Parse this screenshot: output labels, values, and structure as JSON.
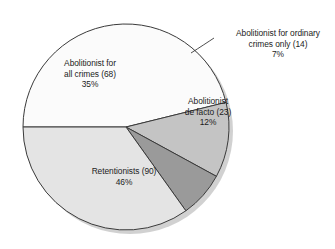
{
  "chart_data": {
    "type": "pie",
    "title": "",
    "subtitle": "",
    "xlabel": "",
    "ylabel": "",
    "legend_position": "none",
    "grid": false,
    "total_count": 195,
    "categories": [
      "Abolitionist for all crimes",
      "Abolitionist for ordinary crimes only",
      "Abolitionist de facto",
      "Retentionists"
    ],
    "values": [
      68,
      14,
      23,
      90
    ],
    "percentages": [
      35,
      7,
      12,
      46
    ],
    "colors": [
      "#e4e4e4",
      "#9a9a9a",
      "#c4c4c4",
      "#fbfbfb"
    ],
    "start_angle_deg": 180,
    "direction": "clockwise",
    "slices": [
      {
        "name": "abolitionist-all-crimes",
        "label_line1": "Abolitionist for",
        "label_line2": "all crimes (68)",
        "percent_label": "35%",
        "count": 68,
        "percent": 35,
        "color": "#e4e4e4",
        "label_placement": "inside"
      },
      {
        "name": "abolitionist-ordinary-crimes-only",
        "label_line1": "Abolitionist for ordinary",
        "label_line2": "crimes only (14)",
        "percent_label": "7%",
        "count": 14,
        "percent": 7,
        "color": "#9a9a9a",
        "label_placement": "callout"
      },
      {
        "name": "abolitionist-de-facto",
        "label_line1": "Abolitionist",
        "label_line2": "de facto (23)",
        "percent_label": "12%",
        "count": 23,
        "percent": 12,
        "color": "#c4c4c4",
        "label_placement": "inside"
      },
      {
        "name": "retentionists",
        "label_line1": "Retentionists (90)",
        "label_line2": "",
        "percent_label": "46%",
        "count": 90,
        "percent": 46,
        "color": "#fbfbfb",
        "label_placement": "inside"
      }
    ],
    "geometry": {
      "center_x": 126,
      "center_y": 127,
      "radius": 103,
      "outline_color": "#3a3a3a",
      "shadow_color": "#c9c9c9"
    }
  }
}
